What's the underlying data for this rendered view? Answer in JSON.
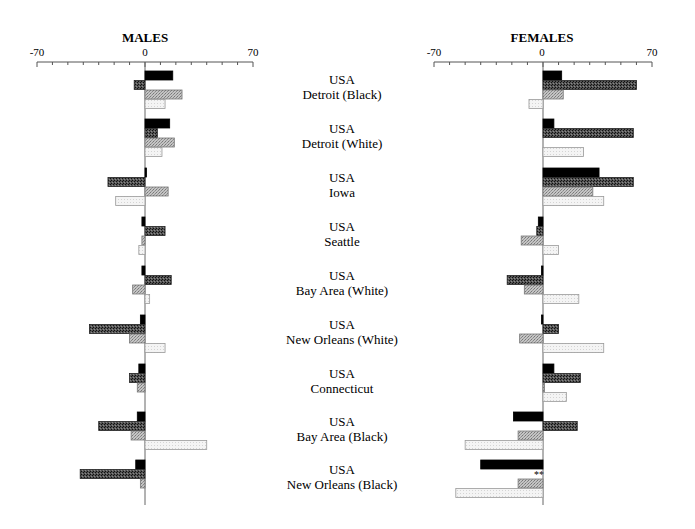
{
  "chart_data": {
    "type": "bar",
    "orientation": "horizontal",
    "grid": false,
    "panels": [
      {
        "title": "MALES",
        "xlim": [
          -70,
          70
        ],
        "tick_labels": [
          "-70",
          "0",
          "70"
        ],
        "minor_tick_step": 10,
        "series": [
          {
            "name": "series-1",
            "style": "solid-black",
            "values": [
              18,
              16,
              1,
              -2,
              -2,
              -3,
              -4,
              -5,
              -6
            ]
          },
          {
            "name": "series-2",
            "style": "dark-crosshatch",
            "values": [
              -7,
              8,
              -24,
              13,
              17,
              -36,
              -10,
              -30,
              -42
            ]
          },
          {
            "name": "series-3",
            "style": "medium-crosshatch",
            "values": [
              24,
              19,
              15,
              -2,
              -8,
              -10,
              -5,
              -9,
              -3
            ]
          },
          {
            "name": "series-4",
            "style": "light-dotted",
            "values": [
              13,
              11,
              -19,
              -4,
              3,
              13,
              0,
              40,
              0
            ]
          }
        ]
      },
      {
        "title": "FEMALES",
        "xlim": [
          -70,
          70
        ],
        "tick_labels": [
          "-70",
          "0",
          "70"
        ],
        "minor_tick_step": 10,
        "series": [
          {
            "name": "series-1",
            "style": "solid-black",
            "values": [
              12,
              7,
              36,
              -3,
              -1,
              -1,
              7,
              -19,
              -40
            ]
          },
          {
            "name": "series-2",
            "style": "dark-crosshatch",
            "values": [
              60,
              58,
              58,
              -4,
              -23,
              10,
              24,
              22,
              null
            ]
          },
          {
            "name": "series-3",
            "style": "medium-crosshatch",
            "values": [
              13,
              0,
              32,
              -14,
              -12,
              -15,
              1,
              -16,
              -16
            ]
          },
          {
            "name": "series-4",
            "style": "light-dotted",
            "values": [
              -9,
              26,
              39,
              10,
              23,
              39,
              15,
              -50,
              -56
            ]
          }
        ],
        "annotations": [
          {
            "category_index": 8,
            "series": "series-2",
            "text": "**"
          }
        ]
      }
    ],
    "categories": [
      {
        "line1": "USA",
        "line2": "Detroit (Black)"
      },
      {
        "line1": "USA",
        "line2": "Detroit (White)"
      },
      {
        "line1": "USA",
        "line2": "Iowa"
      },
      {
        "line1": "USA",
        "line2": "Seattle"
      },
      {
        "line1": "USA",
        "line2": "Bay Area (White)"
      },
      {
        "line1": "USA",
        "line2": "New Orleans (White)"
      },
      {
        "line1": "USA",
        "line2": "Connecticut"
      },
      {
        "line1": "USA",
        "line2": "Bay Area (Black)"
      },
      {
        "line1": "USA",
        "line2": "New Orleans (Black)"
      }
    ],
    "colors": {
      "solid-black": "#000000",
      "dark-crosshatch": "#3a3a3a",
      "medium-crosshatch": "#a8a8a8",
      "light-dotted": "#ececec",
      "axis": "#555555"
    }
  }
}
